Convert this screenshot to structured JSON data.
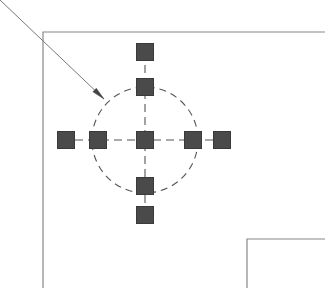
{
  "figure": {
    "width": 325,
    "height": 288,
    "background_color": "#ffffff"
  },
  "colors": {
    "node_fill": "#4a4a4a",
    "node_stroke": "#3a3a3a",
    "dash_line": "#555555",
    "outline": "#888888",
    "leader_line": "#777777",
    "arrow_head": "#444444"
  },
  "outline": {
    "name": "wall-outline",
    "upper_corner": {
      "corner_x": 43,
      "corner_y": 32,
      "extends_right_to": 325,
      "extends_down_to": 288
    },
    "lower_corner": {
      "corner_x": 247,
      "corner_y": 239,
      "extends_right_to": 325,
      "extends_down_to": 288
    },
    "stroke_width": 1.2
  },
  "leader": {
    "name": "leader-arrow",
    "start_x": 0,
    "start_y": 0,
    "end_x": 104,
    "end_y": 99,
    "arrow_head_length": 13,
    "arrow_head_width": 5,
    "points_to": "dashed-circle-upper-left"
  },
  "circle": {
    "name": "bolt-circle",
    "center_x": 145,
    "center_y": 140,
    "radius": 53,
    "style": "dashed",
    "dash_pattern": "7 5",
    "stroke_width": 1.1
  },
  "axes": [
    {
      "name": "horizontal-centerline",
      "orientation": "horizontal",
      "x1": 62,
      "y1": 140,
      "x2": 228,
      "y2": 140,
      "style": "dashed",
      "dash_pattern": "8 5"
    },
    {
      "name": "vertical-centerline",
      "orientation": "vertical",
      "x1": 145,
      "y1": 52,
      "x2": 145,
      "y2": 222,
      "style": "dashed",
      "dash_pattern": "8 5"
    }
  ],
  "nodes": [
    {
      "name": "node-top-outer",
      "label": "top outer",
      "cx": 145,
      "cy": 52,
      "size": 17,
      "position": "top-outer"
    },
    {
      "name": "node-top-on-circle",
      "label": "top on circle",
      "cx": 145,
      "cy": 87,
      "size": 17,
      "position": "top-on-circle"
    },
    {
      "name": "node-left-outer",
      "label": "left outer",
      "cx": 66,
      "cy": 140,
      "size": 17,
      "position": "left-outer"
    },
    {
      "name": "node-left-on-circle",
      "label": "left on circle",
      "cx": 98,
      "cy": 140,
      "size": 17,
      "position": "left-on-circle"
    },
    {
      "name": "node-center",
      "label": "center",
      "cx": 145,
      "cy": 140,
      "size": 17,
      "position": "center"
    },
    {
      "name": "node-right-on-circle",
      "label": "right on circle",
      "cx": 193,
      "cy": 140,
      "size": 17,
      "position": "right-on-circle"
    },
    {
      "name": "node-right-outer",
      "label": "right outer",
      "cx": 222,
      "cy": 140,
      "size": 17,
      "position": "right-outer"
    },
    {
      "name": "node-bottom-on-circle",
      "label": "bottom on circle",
      "cx": 145,
      "cy": 186,
      "size": 17,
      "position": "bottom-on-circle"
    },
    {
      "name": "node-bottom-outer",
      "label": "bottom outer",
      "cx": 145,
      "cy": 215,
      "size": 17,
      "position": "bottom-outer"
    }
  ]
}
